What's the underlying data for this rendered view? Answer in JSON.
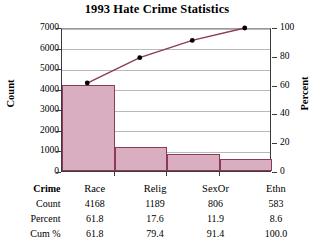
{
  "chart_data": {
    "type": "bar",
    "title": "1993 Hate Crime Statistics",
    "subtitle": "",
    "categories": [
      "Race",
      "Relig",
      "SexOr",
      "Ethn"
    ],
    "xlabel": "Crime",
    "ylabel": "Count",
    "y2label": "Percent",
    "ylim": [
      0,
      7000
    ],
    "y2lim": [
      0,
      100
    ],
    "yticks": [
      0,
      1000,
      2000,
      3000,
      4000,
      5000,
      6000,
      7000
    ],
    "y2ticks": [
      0,
      20,
      40,
      60,
      80,
      100
    ],
    "grid": true,
    "legend": "none",
    "series": [
      {
        "name": "Count",
        "type": "bar",
        "axis": "left",
        "values": [
          4168,
          1189,
          806,
          583
        ]
      },
      {
        "name": "Cum %",
        "type": "line",
        "axis": "right",
        "values": [
          61.8,
          79.4,
          91.4,
          100.0
        ]
      }
    ],
    "percent": [
      61.8,
      17.6,
      11.9,
      8.6
    ],
    "colors": {
      "bar_fill": "#d8aec0",
      "bar_edge": "#8d3a55",
      "line": "#8d3a55",
      "marker": "#000000",
      "grid": "#b9b9b9",
      "axis": "#3a3a3a",
      "background": "#ffffff",
      "text": "#000000"
    }
  },
  "axes": {
    "left": {
      "title": "Count",
      "ticks": [
        "7000",
        "6000",
        "5000",
        "4000",
        "3000",
        "2000",
        "1000",
        "0"
      ]
    },
    "right": {
      "title": "Percent",
      "ticks": [
        "100",
        "80",
        "60",
        "40",
        "20",
        "0"
      ]
    }
  },
  "table": {
    "header_label": "Crime",
    "columns": [
      "Race",
      "Relig",
      "SexOr",
      "Ethn"
    ],
    "rows": [
      {
        "label": "Count",
        "values": [
          "4168",
          "1189",
          "806",
          "583"
        ]
      },
      {
        "label": "Percent",
        "values": [
          "61.8",
          "17.6",
          "11.9",
          "8.6"
        ]
      },
      {
        "label": "Cum %",
        "values": [
          "61.8",
          "79.4",
          "91.4",
          "100.0"
        ]
      }
    ]
  }
}
